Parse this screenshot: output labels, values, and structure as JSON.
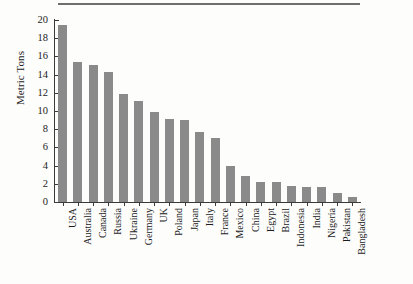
{
  "chart_data": {
    "type": "bar",
    "title": "",
    "xlabel": "",
    "ylabel": "Metric Tons",
    "ylim": [
      0,
      20
    ],
    "yticks": [
      0,
      2,
      4,
      6,
      8,
      10,
      12,
      14,
      16,
      18,
      20
    ],
    "grid": false,
    "legend": null,
    "bar_color": "#8a8a8a",
    "axis_color": "#3a3a3a",
    "categories": [
      "USA",
      "Australia",
      "Canada",
      "Russia",
      "Ukraine",
      "Germany",
      "UK",
      "Poland",
      "Japan",
      "Italy",
      "France",
      "Mexico",
      "China",
      "Egypt",
      "Brazil",
      "Indonesia",
      "India",
      "Nigeria",
      "Pakistan",
      "Bangladesh"
    ],
    "values": [
      19.5,
      15.4,
      15.1,
      14.3,
      11.9,
      11.1,
      9.9,
      9.1,
      9.0,
      7.7,
      7.0,
      4.0,
      2.9,
      2.2,
      2.2,
      1.8,
      1.7,
      1.6,
      1.0,
      0.5
    ]
  },
  "figure": {
    "top_rule": true,
    "background": "#fdfdfc"
  }
}
